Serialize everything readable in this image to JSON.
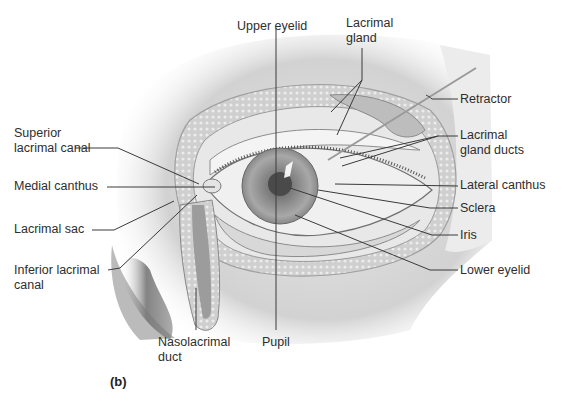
{
  "figure": {
    "panel_label": "(b)",
    "labels": {
      "upper_eyelid": "Upper eyelid",
      "lacrimal_gland_1": "Lacrimal",
      "lacrimal_gland_2": "gland",
      "retractor": "Retractor",
      "lacrimal_gland_ducts_1": "Lacrimal",
      "lacrimal_gland_ducts_2": "gland ducts",
      "lateral_canthus": "Lateral canthus",
      "sclera": "Sclera",
      "iris": "Iris",
      "lower_eyelid": "Lower eyelid",
      "pupil": "Pupil",
      "nasolacrimal_duct_1": "Nasolacrimal",
      "nasolacrimal_duct_2": "duct",
      "inferior_lacrimal_canal_1": "Inferior lacrimal",
      "inferior_lacrimal_canal_2": "canal",
      "lacrimal_sac": "Lacrimal sac",
      "medial_canthus": "Medial canthus",
      "superior_lacrimal_canal_1": "Superior",
      "superior_lacrimal_canal_2": "lacrimal canal"
    },
    "colors": {
      "line": "#3a3a3a",
      "skin": "#d9d9d9",
      "shadow": "#9a9a9a",
      "iris": "#8c8c8c",
      "pupil": "#4a4a4a",
      "sclera": "#f2f2f2"
    }
  }
}
